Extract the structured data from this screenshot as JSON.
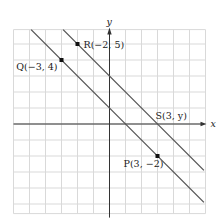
{
  "diagram": {
    "type": "coordinate-plane",
    "grid": {
      "x_range": [
        -6,
        6
      ],
      "y_range": [
        -5.6,
        5.9
      ],
      "unit_px": 16,
      "grid_color": "#d9d9d9"
    },
    "axes": {
      "x_label": "x",
      "y_label": "y",
      "axis_color": "#333333"
    },
    "lines": [
      {
        "name": "line-QP",
        "equation": "y = -x + 1",
        "from": [
          -4.9,
          5.9
        ],
        "to": [
          5.9,
          -4.9
        ],
        "color": "#555555"
      },
      {
        "name": "line-RS",
        "equation": "y = -x + 3",
        "from": [
          -2.9,
          5.9
        ],
        "to": [
          5.9,
          -2.9
        ],
        "color": "#555555"
      }
    ],
    "points": [
      {
        "id": "Q",
        "label": "Q(−3, 4)",
        "x": -3,
        "y": 4,
        "dot": true
      },
      {
        "id": "R",
        "label": "R(−2, 5)",
        "x": -2,
        "y": 5,
        "dot": true
      },
      {
        "id": "S",
        "label": "S(3, y)",
        "x": 3,
        "y": 0,
        "dot": false
      },
      {
        "id": "P",
        "label": "P(3, −2)",
        "x": 3,
        "y": -2,
        "dot": true
      }
    ]
  }
}
